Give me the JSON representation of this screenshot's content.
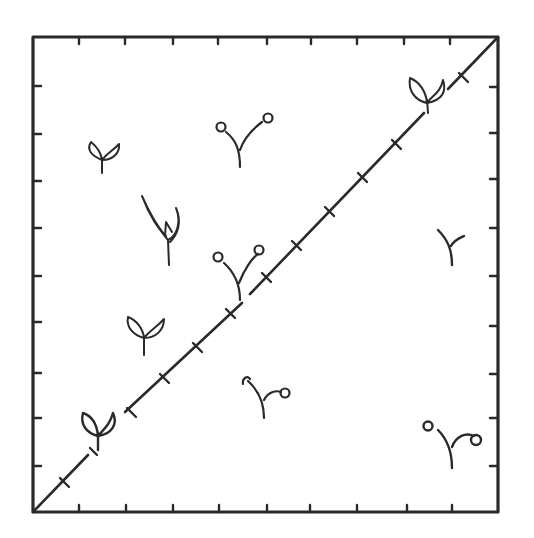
{
  "diagram": {
    "frame": {
      "x": 33,
      "y": 37,
      "width": 465,
      "height": 475,
      "stroke": "#2a2a2a"
    },
    "ink_color": "#2a2a2a",
    "background": "#ffffff",
    "ticks_per_side": 9,
    "diagonal_cross_ticks": 12,
    "seedlings": [
      {
        "id": "s1",
        "type": "two-leaf",
        "x": 102,
        "y": 158
      },
      {
        "id": "s2",
        "type": "curled-cotyledon",
        "x": 240,
        "y": 140
      },
      {
        "id": "s3",
        "type": "tall-sheath",
        "x": 165,
        "y": 230
      },
      {
        "id": "s4",
        "type": "curled-cotyledon",
        "x": 237,
        "y": 270
      },
      {
        "id": "s5",
        "type": "two-leaf",
        "x": 143,
        "y": 335
      },
      {
        "id": "s6",
        "type": "two-leaf",
        "x": 100,
        "y": 430
      },
      {
        "id": "s7",
        "type": "two-leaf",
        "x": 428,
        "y": 95
      },
      {
        "id": "s8",
        "type": "hook",
        "x": 452,
        "y": 245
      },
      {
        "id": "s9",
        "type": "curled-cotyledon",
        "x": 262,
        "y": 395
      },
      {
        "id": "s10",
        "type": "curled-cotyledon",
        "x": 452,
        "y": 440
      }
    ]
  }
}
